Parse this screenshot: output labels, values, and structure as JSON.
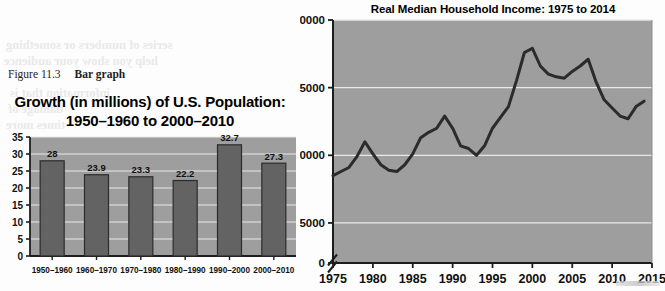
{
  "figure": {
    "number": "Figure 11.3",
    "label": "Bar graph"
  },
  "ghost_text": {
    "lines": [
      "series of numbers or something",
      "help you show your audience",
      "information that is",
      "damage of",
      "times more",
      "pointing earth and the",
      "as may ex",
      "numbe",
      "or the sp",
      "where",
      "anyone",
      "because",
      "the 1"
    ]
  },
  "colors": {
    "plot_background": "#9e9e9e",
    "bar_fill": "#636363",
    "bar_edge": "#2b2b2b",
    "gridline": "#e8e8e8",
    "line_stroke": "#2b2b2b",
    "axis": "#1d1d1d"
  },
  "bar_chart": {
    "title_line1": "Growth (in millions) of U.S. Population:",
    "title_line2": "1950–1960 to 2000–2010",
    "chart_data": {
      "type": "bar",
      "title": "Growth (in millions) of U.S. Population: 1950–1960 to 2000–2010",
      "xlabel": "",
      "ylabel": "",
      "ylim": [
        0,
        35
      ],
      "yticks": [
        0,
        5,
        10,
        15,
        20,
        25,
        30,
        35
      ],
      "ytick_labels": [
        "0",
        "5",
        "10",
        "15",
        "20",
        "25",
        "30",
        "35"
      ],
      "grid": true,
      "legend": "none",
      "categories": [
        "1950–1960",
        "1960–1970",
        "1970–1980",
        "1980–1990",
        "1990–2000",
        "2000–2010"
      ],
      "values": [
        28,
        23.9,
        23.3,
        22.2,
        32.7,
        27.3
      ],
      "data_labels": [
        "28",
        "23.9",
        "23.3",
        "22.2",
        "32.7",
        "27.3"
      ]
    }
  },
  "line_chart": {
    "chart_data": {
      "type": "line",
      "title": "Real Median Household Income: 1975 to 2014",
      "xlabel": "",
      "ylabel": "",
      "xlim": [
        1975,
        2015
      ],
      "ylim": [
        43000,
        60000
      ],
      "axis_break": true,
      "zero_tick_label": "0",
      "yticks": [
        45000,
        50000,
        55000,
        60000
      ],
      "ytick_labels": [
        "45000",
        "50000",
        "55000",
        "60000"
      ],
      "xticks": [
        1975,
        1980,
        1985,
        1990,
        1995,
        2000,
        2005,
        2010,
        2015
      ],
      "xtick_labels": [
        "1975",
        "1980",
        "1985",
        "1990",
        "1995",
        "2000",
        "2005",
        "2010",
        "2015"
      ],
      "grid": true,
      "legend": "none",
      "x": [
        1975,
        1976,
        1977,
        1978,
        1979,
        1980,
        1981,
        1982,
        1983,
        1984,
        1985,
        1986,
        1987,
        1988,
        1989,
        1990,
        1991,
        1992,
        1993,
        1994,
        1995,
        1996,
        1997,
        1998,
        1999,
        2000,
        2001,
        2002,
        2003,
        2004,
        2005,
        2006,
        2007,
        2008,
        2009,
        2010,
        2011,
        2012,
        2013,
        2014
      ],
      "values": [
        48500,
        48800,
        49100,
        49900,
        51000,
        50100,
        49300,
        48900,
        48800,
        49300,
        50100,
        51300,
        51700,
        52000,
        52900,
        52000,
        50700,
        50500,
        50000,
        50700,
        52000,
        52800,
        53600,
        55500,
        57600,
        57900,
        56600,
        56000,
        55800,
        55700,
        56200,
        56600,
        57100,
        55400,
        54100,
        53500,
        52900,
        52700,
        53600,
        54000
      ],
      "annotations": []
    }
  }
}
